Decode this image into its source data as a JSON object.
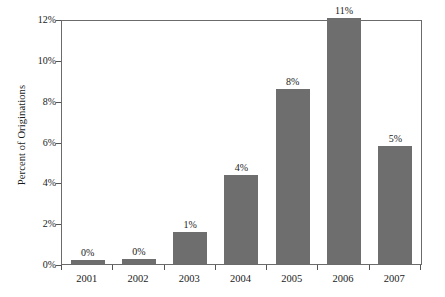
{
  "chart_data": {
    "type": "bar",
    "title": "",
    "subtitle": "",
    "xlabel": "",
    "ylabel": "Percent of Originations",
    "categories": [
      "2001",
      "2002",
      "2003",
      "2004",
      "2005",
      "2006",
      "2007"
    ],
    "values": [
      0.22,
      0.24,
      1.56,
      4.38,
      8.62,
      12.1,
      5.78
    ],
    "data_labels": [
      "0%",
      "0%",
      "1%",
      "4%",
      "8%",
      "11%",
      "5%"
    ],
    "ylim": [
      0,
      12
    ],
    "y_tick_values": [
      0,
      2,
      4,
      6,
      8,
      10,
      12
    ],
    "y_tick_labels": [
      "0%",
      "2%",
      "4%",
      "6%",
      "8%",
      "10%",
      "12%"
    ],
    "grid": false,
    "legend": null,
    "series": [
      {
        "name": "Percent of Originations",
        "color": "#6e6e6e",
        "values": [
          0.22,
          0.24,
          1.56,
          4.38,
          8.62,
          12.1,
          5.78
        ]
      }
    ],
    "colors": {
      "bar": "#6e6e6e",
      "axis": "#6b6b6b",
      "tick": "#555555",
      "text": "#1a1a1a",
      "background": "#ffffff"
    }
  }
}
